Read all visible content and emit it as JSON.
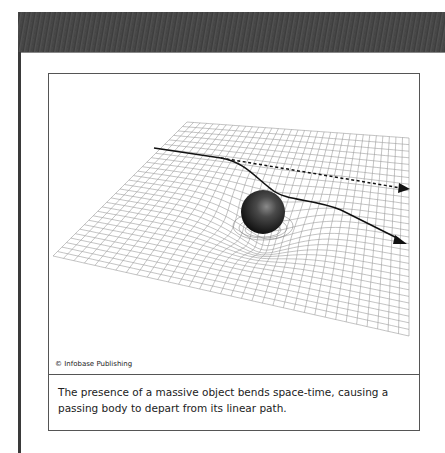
{
  "header": {
    "bar_color": "#444444"
  },
  "figure": {
    "credit": "© Infobase Publishing",
    "caption": "The presence of a massive object bends space-time, causing a passing body to depart from its linear path.",
    "illustration": {
      "subject": "curved space-time grid with massive sphere",
      "elements": [
        "grid-plane",
        "massive-sphere",
        "straight-path-dotted-arrow",
        "deflected-path-solid-arrow"
      ],
      "colors": {
        "grid": "#9a9a9a",
        "sphere": "#2a2a2a",
        "path": "#111111"
      }
    }
  }
}
